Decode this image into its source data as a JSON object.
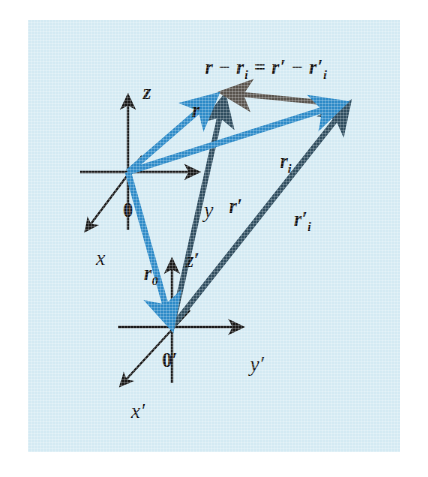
{
  "figure": {
    "panel_background": "#d4eaf3",
    "page_background": "#ffffff",
    "equation": "r − rᵢ = r′ − r′ᵢ",
    "colors": {
      "blue_vector": "#2e8bc8",
      "dark_vector": "#304e60",
      "difference_arrow": "#5a554f",
      "axis": "#1b1b1b",
      "label": "#131313"
    }
  },
  "frames": [
    {
      "name": "unprimed-frame",
      "origin_label": "0",
      "origin_x": 128,
      "origin_y": 172,
      "axes": [
        {
          "name": "z-axis",
          "label": "z",
          "direction": "up",
          "label_x": 122,
          "label_y": 79
        },
        {
          "name": "y-axis",
          "label": "y",
          "direction": "right",
          "label_x": 180,
          "label_y": 190
        },
        {
          "name": "x-axis",
          "label": "x",
          "direction": "down-left",
          "label_x": 72,
          "label_y": 238
        }
      ]
    },
    {
      "name": "primed-frame",
      "origin_label": "0′",
      "origin_x": 172,
      "origin_y": 327,
      "axes": [
        {
          "name": "z-prime-axis",
          "label": "z′",
          "direction": "up",
          "label_x": 163,
          "label_y": 241
        },
        {
          "name": "y-prime-axis",
          "label": "y′",
          "direction": "right",
          "label_x": 226,
          "label_y": 343
        },
        {
          "name": "x-prime-axis",
          "label": "x′",
          "direction": "down-left",
          "label_x": 108,
          "label_y": 392
        }
      ]
    }
  ],
  "vectors": [
    {
      "name": "vector-r",
      "label": "r",
      "color": "#2e8bc8",
      "from_x": 128,
      "from_y": 172,
      "to_x": 213,
      "to_y": 96,
      "label_x": 168,
      "label_y": 92
    },
    {
      "name": "vector-r-i",
      "label": "r",
      "subscript": "i",
      "color": "#2e8bc8",
      "from_x": 128,
      "from_y": 172,
      "to_x": 341,
      "to_y": 101,
      "label_x": 258,
      "label_y": 140
    },
    {
      "name": "vector-r-zero",
      "label": "r",
      "subscript": "0",
      "color": "#2e8bc8",
      "from_x": 128,
      "from_y": 172,
      "to_x": 172,
      "to_y": 327,
      "label_x": 122,
      "label_y": 253
    },
    {
      "name": "vector-r-prime",
      "label": "r′",
      "color": "#304e60",
      "from_x": 172,
      "from_y": 327,
      "to_x": 223,
      "to_y": 99,
      "label_x": 206,
      "label_y": 186
    },
    {
      "name": "vector-r-prime-i",
      "label": "r′",
      "subscript": "i",
      "color": "#304e60",
      "from_x": 172,
      "from_y": 327,
      "to_x": 346,
      "to_y": 104,
      "label_x": 272,
      "label_y": 199
    },
    {
      "name": "vector-difference",
      "label": "",
      "color": "#5a554f",
      "from_x": 338,
      "from_y": 103,
      "to_x": 224,
      "to_y": 92,
      "label_x": 0,
      "label_y": 0
    }
  ],
  "equation_parts": {
    "r": "r",
    "minus": "−",
    "r_sub_i": "i",
    "equals": "=",
    "r_prime": "r",
    "prime_mark": "′",
    "r_prime_sub_i": "i"
  }
}
